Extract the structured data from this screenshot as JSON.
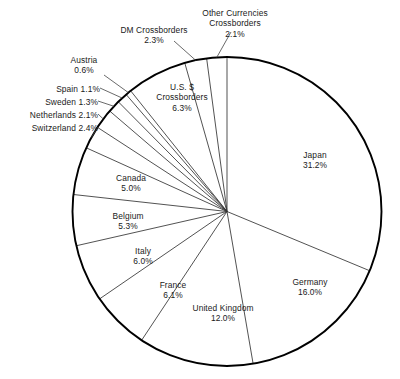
{
  "chart_data": {
    "type": "pie",
    "title": "",
    "subtitle": "",
    "xlabel": "",
    "ylabel": "",
    "legend_position": "none",
    "grid": false,
    "units": "percent",
    "start_angle_deg": 0,
    "direction": "clockwise",
    "categories": [
      "Japan",
      "Germany",
      "United Kingdom",
      "France",
      "Italy",
      "Belgium",
      "Canada",
      "Switzerland",
      "Netherlands",
      "Sweden",
      "Spain",
      "Austria",
      "U.S. $ Crossborders",
      "DM Crossborders",
      "Other Currencies Crossborders"
    ],
    "values": [
      31.2,
      16.0,
      12.0,
      6.1,
      6.0,
      5.3,
      5.0,
      2.4,
      2.1,
      1.3,
      1.1,
      0.6,
      6.3,
      2.3,
      2.1
    ],
    "slices": [
      {
        "name": "Japan",
        "value": 31.2,
        "label_value": "31.2%",
        "label_lines": [
          "Japan",
          "31.2%"
        ]
      },
      {
        "name": "Germany",
        "value": 16.0,
        "label_value": "16.0%",
        "label_lines": [
          "Germany",
          "16.0%"
        ]
      },
      {
        "name": "United Kingdom",
        "value": 12.0,
        "label_value": "12.0%",
        "label_lines": [
          "United Kingdom",
          "12.0%"
        ]
      },
      {
        "name": "France",
        "value": 6.1,
        "label_value": "6.1%",
        "label_lines": [
          "France",
          "6.1%"
        ]
      },
      {
        "name": "Italy",
        "value": 6.0,
        "label_value": "6.0%",
        "label_lines": [
          "Italy",
          "6.0%"
        ]
      },
      {
        "name": "Belgium",
        "value": 5.3,
        "label_value": "5.3%",
        "label_lines": [
          "Belgium",
          "5.3%"
        ]
      },
      {
        "name": "Canada",
        "value": 5.0,
        "label_value": "5.0%",
        "label_lines": [
          "Canada",
          "5.0%"
        ]
      },
      {
        "name": "Switzerland",
        "value": 2.4,
        "label_value": "2.4%",
        "label_lines": [
          "Switzerland 2.4%"
        ]
      },
      {
        "name": "Netherlands",
        "value": 2.1,
        "label_value": "2.1%",
        "label_lines": [
          "Netherlands 2.1%"
        ]
      },
      {
        "name": "Sweden",
        "value": 1.3,
        "label_value": "1.3%",
        "label_lines": [
          "Sweden 1.3%"
        ]
      },
      {
        "name": "Spain",
        "value": 1.1,
        "label_value": "1.1%",
        "label_lines": [
          "Spain 1.1%"
        ]
      },
      {
        "name": "Austria",
        "value": 0.6,
        "label_value": "0.6%",
        "label_lines": [
          "Austria",
          "0.6%"
        ]
      },
      {
        "name": "U.S. $ Crossborders",
        "value": 6.3,
        "label_value": "6.3%",
        "label_lines": [
          "U.S. $",
          "Crossborders",
          "6.3%"
        ]
      },
      {
        "name": "DM Crossborders",
        "value": 2.3,
        "label_value": "2.3%",
        "label_lines": [
          "DM Crossborders",
          "2.3%"
        ]
      },
      {
        "name": "Other Currencies Crossborders",
        "value": 2.1,
        "label_value": "2.1%",
        "label_lines": [
          "Other Currencies",
          "Crossborders",
          "2.1%"
        ]
      }
    ],
    "colors": {
      "slice_fill": "#ffffff",
      "slice_stroke": "#333333",
      "outline": "#000000",
      "text": "#1a1a1a",
      "background": "#ffffff"
    }
  },
  "labels": {
    "japan": {
      "name": "Japan",
      "value": "31.2%"
    },
    "germany": {
      "name": "Germany",
      "value": "16.0%"
    },
    "united_kingdom": {
      "name": "United Kingdom",
      "value": "12.0%"
    },
    "france": {
      "name": "France",
      "value": "6.1%"
    },
    "italy": {
      "name": "Italy",
      "value": "6.0%"
    },
    "belgium": {
      "name": "Belgium",
      "value": "5.3%"
    },
    "canada": {
      "name": "Canada",
      "value": "5.0%"
    },
    "switzerland": {
      "name": "Switzerland",
      "value": "2.4%"
    },
    "netherlands": {
      "name": "Netherlands",
      "value": "2.1%"
    },
    "sweden": {
      "name": "Sweden",
      "value": "1.3%"
    },
    "spain": {
      "name": "Spain",
      "value": "1.1%"
    },
    "austria": {
      "name": "Austria",
      "value": "0.6%"
    },
    "usd_crossborders": {
      "name_line1": "U.S. $",
      "name_line2": "Crossborders",
      "value": "6.3%"
    },
    "dm_crossborders": {
      "name": "DM Crossborders",
      "value": "2.3%"
    },
    "other_crossborders": {
      "name_line1": "Other Currencies",
      "name_line2": "Crossborders",
      "value": "2.1%"
    }
  }
}
